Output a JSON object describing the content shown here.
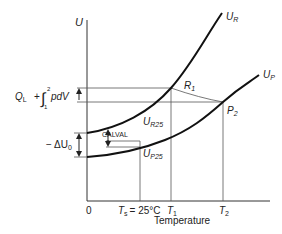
{
  "diagram": {
    "type": "energy-temperature diagram",
    "y_axis_label": "U",
    "x_axis_label": "Temperature",
    "origin_label": "0",
    "x_ticks": {
      "ts_main": "T",
      "ts_sub": "s",
      "ts_eq": "= 25°C",
      "t1_main": "T",
      "t1_sub": "1",
      "t2_main": "T",
      "t2_sub": "2"
    },
    "curves": {
      "reactants": {
        "main": "U",
        "sub": "R"
      },
      "products": {
        "main": "U",
        "sub": "P"
      }
    },
    "points": {
      "r1": {
        "main": "R",
        "sub": "1"
      },
      "p2": {
        "main": "P",
        "sub": "2"
      },
      "ur25": {
        "main": "U",
        "sub": "R25"
      },
      "up25": {
        "main": "U",
        "sub": "P25"
      }
    },
    "annotations": {
      "heat_work": {
        "q": "Q",
        "q_sub": "L",
        "plus": "+",
        "int_upper": "2",
        "int_lower": "1",
        "integrand": "pdV"
      },
      "delta_u": {
        "prefix": "− ΔU",
        "sub": "0"
      },
      "calval": "CALVAL"
    },
    "colors": {
      "line": "#222222",
      "curve": "#111111",
      "grid": "#555555"
    }
  }
}
